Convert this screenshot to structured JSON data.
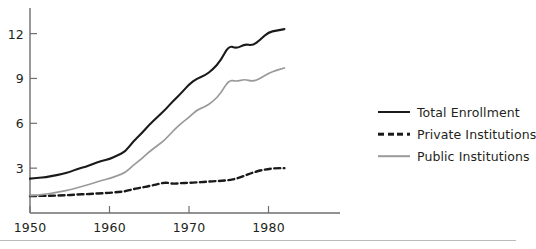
{
  "chart_data": {
    "type": "line",
    "title": "",
    "subtitle": "",
    "xlabel": "",
    "ylabel": "",
    "xlim": [
      1950,
      1984
    ],
    "ylim": [
      0,
      13.2
    ],
    "xticks": [
      1950,
      1960,
      1970,
      1980
    ],
    "xtick_labels": [
      "1950",
      "1960",
      "1970",
      "1980"
    ],
    "yticks": [
      3,
      6,
      9,
      12
    ],
    "ytick_labels": [
      "3",
      "6",
      "9",
      "12"
    ],
    "grid": false,
    "legend_position": "right",
    "x": [
      1950,
      1951,
      1952,
      1953,
      1954,
      1955,
      1956,
      1957,
      1958,
      1959,
      1960,
      1961,
      1962,
      1963,
      1964,
      1965,
      1966,
      1967,
      1968,
      1969,
      1970,
      1971,
      1972,
      1973,
      1974,
      1975,
      1976,
      1977,
      1978,
      1979,
      1980,
      1981,
      1982
    ],
    "series": [
      {
        "name": "Total Enrollment",
        "color": "#1a1a1a",
        "style": "solid",
        "values": [
          2.3,
          2.35,
          2.4,
          2.5,
          2.6,
          2.75,
          2.95,
          3.1,
          3.3,
          3.5,
          3.6,
          3.85,
          4.1,
          4.8,
          5.3,
          5.9,
          6.4,
          6.9,
          7.5,
          8.0,
          8.6,
          9.0,
          9.2,
          9.6,
          10.2,
          11.2,
          11.0,
          11.3,
          11.2,
          11.6,
          12.1,
          12.2,
          12.3
        ],
        "units": "millions"
      },
      {
        "name": "Private Institutions",
        "color": "#1a1a1a",
        "style": "dashed",
        "values": [
          1.14,
          1.14,
          1.15,
          1.16,
          1.18,
          1.2,
          1.24,
          1.26,
          1.29,
          1.32,
          1.35,
          1.4,
          1.45,
          1.6,
          1.7,
          1.8,
          1.92,
          2.05,
          1.95,
          2.0,
          2.02,
          2.05,
          2.08,
          2.12,
          2.15,
          2.2,
          2.3,
          2.5,
          2.7,
          2.85,
          2.95,
          3.0,
          3.0
        ],
        "units": "millions"
      },
      {
        "name": "Public Institutions",
        "color": "#9a9a9a",
        "style": "solid",
        "values": [
          1.16,
          1.2,
          1.26,
          1.35,
          1.45,
          1.55,
          1.7,
          1.85,
          2.0,
          2.18,
          2.3,
          2.5,
          2.7,
          3.2,
          3.6,
          4.1,
          4.5,
          4.9,
          5.5,
          6.0,
          6.4,
          6.9,
          7.1,
          7.45,
          8.0,
          8.9,
          8.8,
          8.95,
          8.8,
          9.0,
          9.35,
          9.55,
          9.7
        ],
        "units": "millions"
      }
    ],
    "legend": [
      {
        "label": "Total Enrollment",
        "style": "solid",
        "color": "#1a1a1a"
      },
      {
        "label": "Private Institutions",
        "style": "dashed",
        "color": "#1a1a1a"
      },
      {
        "label": "Public Institutions",
        "style": "solid",
        "color": "#9a9a9a"
      }
    ]
  },
  "axis": {
    "line_color": "#6e6e6e",
    "y_axis_x": 30,
    "x_axis_y": 213
  },
  "colors": {
    "total": "#1a1a1a",
    "private": "#1a1a1a",
    "public": "#9a9a9a",
    "axis": "#6e6e6e",
    "rule": "#b9b9b9",
    "text": "#231f20"
  }
}
